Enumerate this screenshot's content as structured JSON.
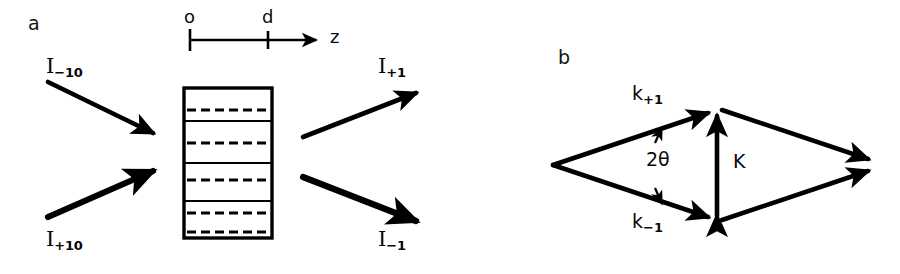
{
  "figure": {
    "width": 900,
    "height": 274,
    "background": "#ffffff",
    "ink_color": "#000000"
  },
  "panels": [
    {
      "id": "a",
      "label": "a",
      "label_pos": {
        "x": 28,
        "y": 22
      },
      "description": "Two-beam coupling in a thick holographic grating: incident beams I_-10 and I_+10 enter a grating slab of thickness d and produce diffracted beams I_+1 and I_-1.",
      "axis": {
        "name": "z-axis",
        "axis_label": "z",
        "tick_labels": [
          "o",
          "d"
        ],
        "origin_label": "o",
        "thickness_label": "d",
        "line": {
          "x1": 190,
          "y1": 40,
          "x2": 312,
          "y2": 40
        },
        "arrow_tip_x": 322,
        "ticks": [
          {
            "label": "o",
            "x": 190,
            "label_x": 184,
            "label_y": 10
          },
          {
            "label": "d",
            "x": 268,
            "label_x": 262,
            "label_y": 10
          }
        ],
        "z_label_pos": {
          "x": 328,
          "y": 30
        }
      },
      "grating": {
        "name": "grating-slab",
        "x": 184,
        "y": 88,
        "width": 88,
        "height": 150,
        "border_width": 3,
        "solid_fringe_ys": [
          121,
          163,
          201
        ],
        "dashed_fringe_ys": [
          110,
          143,
          180,
          213,
          234
        ],
        "dash_pattern": "9 5"
      },
      "beams": [
        {
          "name": "incident-beam-minus",
          "label": "I",
          "subscript": "−10",
          "label_pos": {
            "x": 46,
            "y": 58
          },
          "x1": 48,
          "y1": 82,
          "x2": 160,
          "y2": 136,
          "stroke_width": 4.5,
          "head": "end"
        },
        {
          "name": "incident-beam-plus",
          "label": "I",
          "subscript": "+10",
          "label_pos": {
            "x": 46,
            "y": 232
          },
          "x1": 48,
          "y1": 217,
          "x2": 160,
          "y2": 168,
          "stroke_width": 6,
          "head": "end"
        },
        {
          "name": "diffracted-beam-plus",
          "label": "I",
          "subscript": "+1",
          "label_pos": {
            "x": 378,
            "y": 58
          },
          "x1": 303,
          "y1": 137,
          "x2": 424,
          "y2": 90,
          "stroke_width": 4.5,
          "head": "end"
        },
        {
          "name": "diffracted-beam-minus",
          "label": "I",
          "subscript": "−1",
          "label_pos": {
            "x": 378,
            "y": 232
          },
          "x1": 303,
          "y1": 177,
          "x2": 424,
          "y2": 225,
          "stroke_width": 6,
          "head": "end"
        }
      ]
    },
    {
      "id": "b",
      "label": "b",
      "label_pos": {
        "x": 558,
        "y": 55
      },
      "description": "Wave-vector (Ewald) diagram: incident wave vectors k_+1 and k_-1 separated by angle 2 theta combine with grating vector K.",
      "vertices": {
        "left": {
          "x": 553,
          "y": 165
        },
        "top": {
          "x": 717,
          "y": 109
        },
        "bottom": {
          "x": 717,
          "y": 221
        },
        "right": {
          "x": 877,
          "y": 165
        }
      },
      "vectors": [
        {
          "name": "k-plus-one-vector",
          "label": "k",
          "subscript": "+1",
          "label_pos": {
            "x": 632,
            "y": 88
          },
          "x1": 553,
          "y1": 165,
          "x2": 714,
          "y2": 111,
          "stroke_width": 4.5,
          "head": "end"
        },
        {
          "name": "k-minus-one-vector",
          "label": "k",
          "subscript": "−1",
          "label_pos": {
            "x": 632,
            "y": 216
          },
          "x1": 553,
          "y1": 165,
          "x2": 714,
          "y2": 219,
          "stroke_width": 4.5,
          "head": "end"
        },
        {
          "name": "grating-vector-K",
          "label": "K",
          "subscript": "",
          "label_pos": {
            "x": 731,
            "y": 155
          },
          "x1": 717,
          "y1": 219,
          "x2": 717,
          "y2": 111,
          "stroke_width": 4.5,
          "head": "both"
        },
        {
          "name": "upper-resultant-vector",
          "x1": 719,
          "y1": 109,
          "x2": 874,
          "y2": 161,
          "stroke_width": 4.5,
          "head": "end"
        },
        {
          "name": "lower-resultant-vector",
          "x1": 719,
          "y1": 221,
          "x2": 874,
          "y2": 170,
          "stroke_width": 4.5,
          "head": "end"
        }
      ],
      "angle_annotation": {
        "name": "two-theta-angle",
        "label": "2θ",
        "label_pos": {
          "x": 646,
          "y": 152
        },
        "upper_pointer": {
          "x1": 654,
          "y1": 142,
          "x2": 661,
          "y2": 128
        },
        "lower_pointer": {
          "x1": 654,
          "y1": 189,
          "x2": 661,
          "y2": 203
        }
      }
    }
  ]
}
